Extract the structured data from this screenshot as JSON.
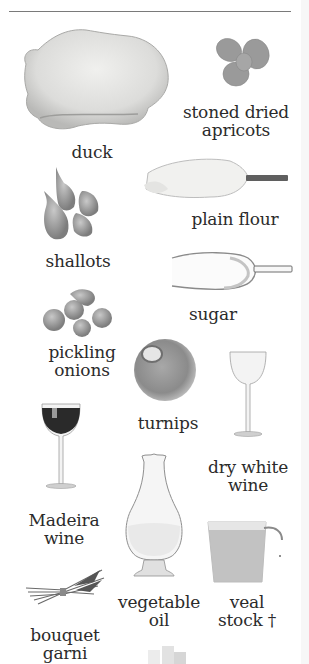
{
  "page": {
    "ingredients": [
      {
        "id": "duck",
        "label": "duck",
        "icon": "duck-icon"
      },
      {
        "id": "apricots",
        "label_lines": [
          "stoned dried",
          "apricots"
        ],
        "icon": "apricots-icon"
      },
      {
        "id": "flour",
        "label": "plain flour",
        "icon": "flour-scoop-icon"
      },
      {
        "id": "shallots",
        "label": "shallots",
        "icon": "shallots-icon"
      },
      {
        "id": "sugar",
        "label": "sugar",
        "icon": "sugar-scoop-icon"
      },
      {
        "id": "pickling_onions",
        "label_lines": [
          "pickling",
          "onions"
        ],
        "icon": "pickling-onions-icon"
      },
      {
        "id": "turnips",
        "label": "turnips",
        "icon": "turnip-icon"
      },
      {
        "id": "dry_white_wine",
        "label_lines": [
          "dry white",
          "wine"
        ],
        "icon": "white-wine-glass-icon"
      },
      {
        "id": "madeira",
        "label_lines": [
          "Madeira",
          "wine"
        ],
        "icon": "red-wine-glass-icon"
      },
      {
        "id": "vegetable_oil",
        "label_lines": [
          "vegetable",
          "oil"
        ],
        "icon": "oil-carafe-icon"
      },
      {
        "id": "veal_stock",
        "label_lines": [
          "veal",
          "stock †"
        ],
        "icon": "measuring-jug-icon"
      },
      {
        "id": "bouquet_garni",
        "label_lines": [
          "bouquet",
          "garni"
        ],
        "icon": "bouquet-garni-icon"
      }
    ]
  }
}
